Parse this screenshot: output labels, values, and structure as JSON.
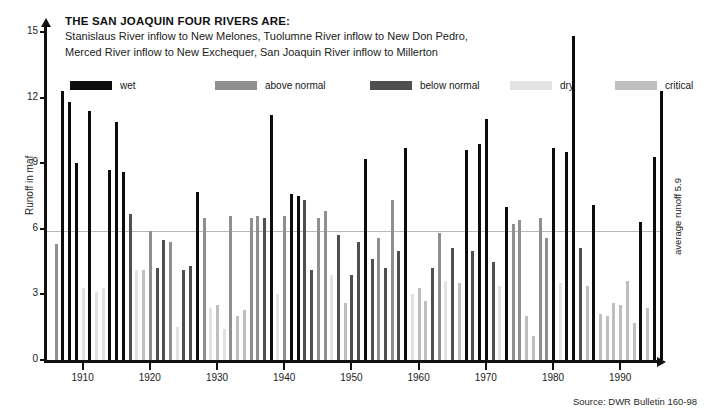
{
  "header": {
    "title": "THE SAN JOAQUIN FOUR RIVERS  ARE:",
    "line1": "Stanislaus River inflow to New Melones, Tuolumne River inflow to New Don Pedro,",
    "line2": "Merced River inflow to New Exchequer, San Joaquin River inflow to Millerton"
  },
  "legend": {
    "position": "top",
    "items": [
      {
        "label": "wet",
        "color": "#0d0d0d",
        "x": 0
      },
      {
        "label": "above normal",
        "color": "#8f8f8f",
        "x": 145
      },
      {
        "label": "below normal",
        "color": "#4f4f4f",
        "x": 300
      },
      {
        "label": "dry",
        "color": "#e2e2e2",
        "x": 440
      },
      {
        "label": "critical",
        "color": "#bfbfbf",
        "x": 545
      }
    ]
  },
  "axes": {
    "ylabel": "Runoff in maf",
    "yticks": [
      0,
      3,
      6,
      9,
      12,
      15
    ],
    "ylim": [
      0,
      15
    ],
    "xticks": [
      1910,
      1920,
      1930,
      1940,
      1950,
      1960,
      1970,
      1980,
      1990
    ],
    "xlim": [
      1905,
      1997
    ]
  },
  "annotations": {
    "average_label": "average runoff 5.9",
    "average_value": 5.9,
    "source": "Source: DWR Bulletin 160-98"
  },
  "chart_data": {
    "type": "bar",
    "title": "THE SAN JOAQUIN FOUR RIVERS  ARE:",
    "xlabel": "",
    "ylabel": "Runoff in maf",
    "ylim": [
      0,
      15
    ],
    "xlim": [
      1905,
      1997
    ],
    "grid": false,
    "legend": [
      "wet",
      "above normal",
      "below normal",
      "dry",
      "critical"
    ],
    "class_colors": {
      "wet": "#0d0d0d",
      "above normal": "#8f8f8f",
      "below normal": "#4f4f4f",
      "dry": "#e2e2e2",
      "critical": "#bfbfbf"
    },
    "categories": [
      1906,
      1907,
      1908,
      1909,
      1910,
      1911,
      1912,
      1913,
      1914,
      1915,
      1916,
      1917,
      1918,
      1919,
      1920,
      1921,
      1922,
      1923,
      1924,
      1925,
      1926,
      1927,
      1928,
      1929,
      1930,
      1931,
      1932,
      1933,
      1934,
      1935,
      1936,
      1937,
      1938,
      1939,
      1940,
      1941,
      1942,
      1943,
      1944,
      1945,
      1946,
      1947,
      1948,
      1949,
      1950,
      1951,
      1952,
      1953,
      1954,
      1955,
      1956,
      1957,
      1958,
      1959,
      1960,
      1961,
      1962,
      1963,
      1964,
      1965,
      1966,
      1967,
      1968,
      1969,
      1970,
      1971,
      1972,
      1973,
      1974,
      1975,
      1976,
      1977,
      1978,
      1979,
      1980,
      1981,
      1982,
      1983,
      1984,
      1985,
      1986,
      1987,
      1988,
      1989,
      1990,
      1991,
      1992,
      1993,
      1994,
      1995,
      1996
    ],
    "values": [
      5.3,
      12.3,
      11.8,
      9.0,
      3.3,
      11.4,
      3.1,
      3.3,
      8.7,
      10.9,
      8.6,
      6.7,
      4.1,
      4.1,
      5.9,
      4.2,
      5.5,
      5.4,
      1.5,
      4.1,
      4.3,
      7.7,
      6.5,
      2.4,
      2.5,
      1.4,
      6.6,
      2.0,
      2.3,
      6.5,
      6.6,
      6.5,
      11.2,
      3.0,
      6.6,
      7.6,
      7.5,
      7.3,
      4.1,
      6.5,
      6.8,
      3.9,
      5.7,
      2.6,
      3.9,
      5.4,
      9.2,
      4.6,
      5.6,
      4.2,
      7.3,
      5.0,
      9.7,
      3.0,
      3.3,
      2.7,
      4.2,
      5.8,
      3.6,
      5.1,
      3.5,
      9.6,
      5.0,
      9.9,
      11.0,
      4.5,
      3.4,
      7.0,
      6.2,
      6.4,
      2.0,
      1.1,
      6.5,
      5.6,
      9.7,
      3.5,
      9.5,
      14.8,
      5.1,
      3.4,
      7.1,
      2.1,
      2.0,
      2.6,
      2.5,
      3.6,
      1.7,
      6.3,
      2.4,
      9.3,
      12.3
    ],
    "classes": [
      "above normal",
      "wet",
      "wet",
      "wet",
      "dry",
      "wet",
      "dry",
      "dry",
      "wet",
      "wet",
      "wet",
      "below normal",
      "dry",
      "critical",
      "above normal",
      "below normal",
      "below normal",
      "above normal",
      "dry",
      "below normal",
      "below normal",
      "wet",
      "above normal",
      "dry",
      "critical",
      "dry",
      "above normal",
      "critical",
      "critical",
      "above normal",
      "above normal",
      "below normal",
      "wet",
      "dry",
      "above normal",
      "wet",
      "wet",
      "below normal",
      "below normal",
      "above normal",
      "above normal",
      "dry",
      "below normal",
      "critical",
      "below normal",
      "below normal",
      "wet",
      "below normal",
      "above normal",
      "below normal",
      "above normal",
      "below normal",
      "wet",
      "dry",
      "critical",
      "critical",
      "below normal",
      "above normal",
      "dry",
      "below normal",
      "critical",
      "wet",
      "below normal",
      "wet",
      "wet",
      "below normal",
      "dry",
      "wet",
      "above normal",
      "above normal",
      "critical",
      "critical",
      "above normal",
      "above normal",
      "wet",
      "dry",
      "wet",
      "wet",
      "below normal",
      "critical",
      "wet",
      "critical",
      "critical",
      "critical",
      "critical",
      "critical",
      "critical",
      "wet",
      "critical",
      "wet",
      "wet"
    ]
  }
}
